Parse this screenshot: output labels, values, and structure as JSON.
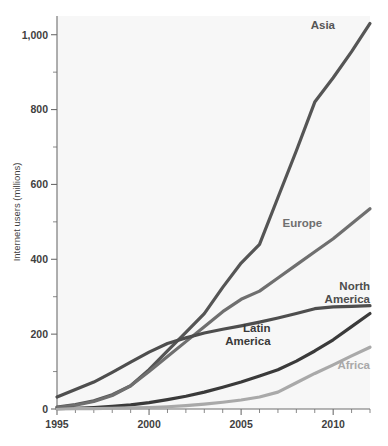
{
  "chart_data": {
    "type": "line",
    "title": "",
    "xlabel": "",
    "ylabel": "Internet users (millions)",
    "xlim": [
      1995,
      2012
    ],
    "ylim": [
      0,
      1050
    ],
    "grid": false,
    "legend_position": "inline-end-of-line",
    "x": [
      1995,
      1996,
      1997,
      1998,
      1999,
      2000,
      2001,
      2002,
      2003,
      2004,
      2005,
      2006,
      2007,
      2008,
      2009,
      2010,
      2011,
      2012
    ],
    "x_tick_values": [
      1995,
      1996,
      1997,
      1998,
      1999,
      2000,
      2001,
      2002,
      2003,
      2004,
      2005,
      2006,
      2007,
      2008,
      2009,
      2010,
      2011,
      2012
    ],
    "x_tick_labels": [
      "1995",
      "",
      "",
      "",
      "",
      "2000",
      "",
      "",
      "",
      "",
      "2005",
      "",
      "",
      "",
      "",
      "2010",
      "",
      ""
    ],
    "y_tick_values": [
      0,
      100,
      200,
      300,
      400,
      500,
      600,
      700,
      800,
      900,
      1000
    ],
    "y_tick_labels": [
      "0",
      "",
      "200",
      "",
      "400",
      "",
      "600",
      "",
      "800",
      "",
      "1,000"
    ],
    "series": [
      {
        "name": "Asia",
        "color": "#555555",
        "label": "Asia",
        "label_x": 2010.1,
        "label_y": 1015,
        "label_anchor": "end",
        "values": [
          5,
          12,
          22,
          38,
          62,
          105,
          155,
          205,
          255,
          325,
          390,
          440,
          565,
          690,
          820,
          885,
          955,
          1030
        ]
      },
      {
        "name": "Europe",
        "color": "#6f6f6f",
        "label": "Europe",
        "label_x": 2009.4,
        "label_y": 487,
        "label_anchor": "end",
        "values": [
          4,
          10,
          20,
          36,
          62,
          100,
          140,
          180,
          220,
          260,
          293,
          315,
          350,
          385,
          420,
          455,
          495,
          535
        ]
      },
      {
        "name": "North America",
        "color": "#4e4e4e",
        "label": "North America",
        "label_x": 2012,
        "label_y": 318,
        "label_anchor": "end",
        "values": [
          32,
          52,
          72,
          98,
          125,
          152,
          175,
          190,
          203,
          213,
          222,
          232,
          243,
          255,
          268,
          273,
          274,
          276
        ]
      },
      {
        "name": "Latin America",
        "color": "#3a3a3a",
        "label": "Latin America",
        "label_x": 2006.6,
        "label_y": 205,
        "label_anchor": "end",
        "values": [
          1,
          2,
          4,
          7,
          11,
          17,
          25,
          34,
          45,
          58,
          72,
          88,
          105,
          128,
          155,
          185,
          220,
          255
        ]
      },
      {
        "name": "Africa",
        "color": "#a9a9a9",
        "label": "Africa",
        "label_x": 2012,
        "label_y": 108,
        "label_anchor": "end",
        "values": [
          0,
          1,
          1,
          2,
          3,
          4,
          6,
          9,
          13,
          18,
          24,
          32,
          45,
          70,
          95,
          118,
          142,
          165
        ]
      }
    ]
  }
}
